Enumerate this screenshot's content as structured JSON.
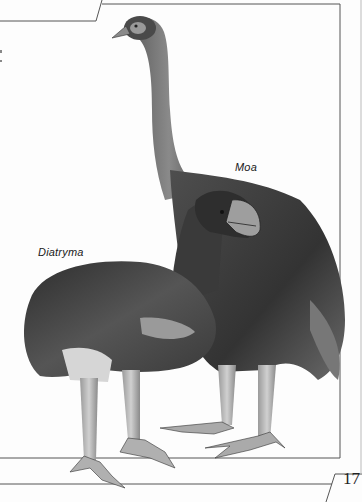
{
  "page": {
    "type": "book-page-illustration",
    "page_number": "17"
  },
  "illustration": {
    "description": "Pencil illustration of two extinct flightless birds",
    "labels": {
      "moa": "Moa",
      "diatryma": "Diatryma"
    }
  },
  "colors": {
    "background": "#fdfdfd",
    "frame_line": "#555555",
    "plumage_dark": "#3a3a3a",
    "plumage_mid": "#6e6e6e",
    "legs": "#b8b8b8"
  }
}
